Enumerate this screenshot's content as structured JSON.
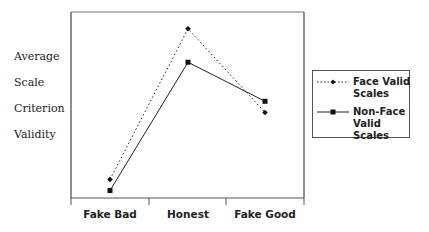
{
  "chart_data": {
    "type": "line",
    "title": "",
    "xlabel": "",
    "ylabel": "Average Scale Criterion Validity",
    "ylabel_lines": [
      "Average",
      "Scale",
      "Criterion",
      "Validity"
    ],
    "categories": [
      "Fake Bad",
      "Honest",
      "Fake Good"
    ],
    "ylim": [
      0,
      10
    ],
    "y_ticks_shown": false,
    "grid": false,
    "legend_position": "right",
    "series": [
      {
        "name": "Face Valid Scales",
        "line_style": "dotted",
        "marker": "diamond",
        "values": [
          1.0,
          9.1,
          4.6
        ]
      },
      {
        "name": "Non-Face Valid Scales",
        "line_style": "solid",
        "marker": "square",
        "values": [
          0.4,
          7.3,
          5.2
        ]
      }
    ]
  },
  "legend": {
    "items": [
      {
        "line1": "Face Valid",
        "line2": "Scales"
      },
      {
        "line1": "Non-Face",
        "line2": "Valid Scales"
      }
    ]
  },
  "colors": {
    "line": "#222222",
    "frame": "#555555"
  }
}
